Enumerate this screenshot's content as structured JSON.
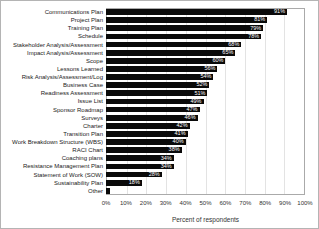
{
  "chart_data": {
    "type": "bar",
    "orientation": "horizontal",
    "title": "",
    "xlabel": "Percent of respondents",
    "ylabel": "",
    "xlim": [
      0,
      100
    ],
    "grid": true,
    "legend": "none",
    "bar_color": "#0a0a0a",
    "bar_label_color": "#ffffff",
    "gridline_color": "#e3e3e3",
    "x_ticks": [
      "0%",
      "10%",
      "20%",
      "30%",
      "40%",
      "50%",
      "60%",
      "70%",
      "80%",
      "90%",
      "100%"
    ],
    "x_tick_values": [
      0,
      10,
      20,
      30,
      40,
      50,
      60,
      70,
      80,
      90,
      100
    ],
    "categories": [
      "Communications Plan",
      "Project Plan",
      "Training Plan",
      "Schedule",
      "Stakeholder Analysis/Assessment",
      "Impact Analysis/Assessment",
      "Scope",
      "Lessons Learned",
      "Risk Analysis/Assessment/Log",
      "Business Case",
      "Readiness Assessment",
      "Issue List",
      "Sponsor Roadmap",
      "Surveys",
      "Charter",
      "Transition Plan",
      "Work Breakdown Structure (WBS)",
      "RACI Chart",
      "Coaching plans",
      "Resistance Management Plan",
      "Statement of Work (SOW)",
      "Sustainability Plan",
      "Other"
    ],
    "values": [
      91,
      81,
      79,
      78,
      68,
      65,
      60,
      56,
      54,
      52,
      51,
      49,
      47,
      46,
      42,
      41,
      40,
      38,
      34,
      34,
      28,
      18,
      2
    ],
    "bar_labels": [
      "91%",
      "81%",
      "79%",
      "78%",
      "68%",
      "65%",
      "60%",
      "56%",
      "54%",
      "52%",
      "51%",
      "49%",
      "47%",
      "46%",
      "42%",
      "41%",
      "40%",
      "38%",
      "34%",
      "34%",
      "28%",
      "18%",
      ""
    ]
  }
}
